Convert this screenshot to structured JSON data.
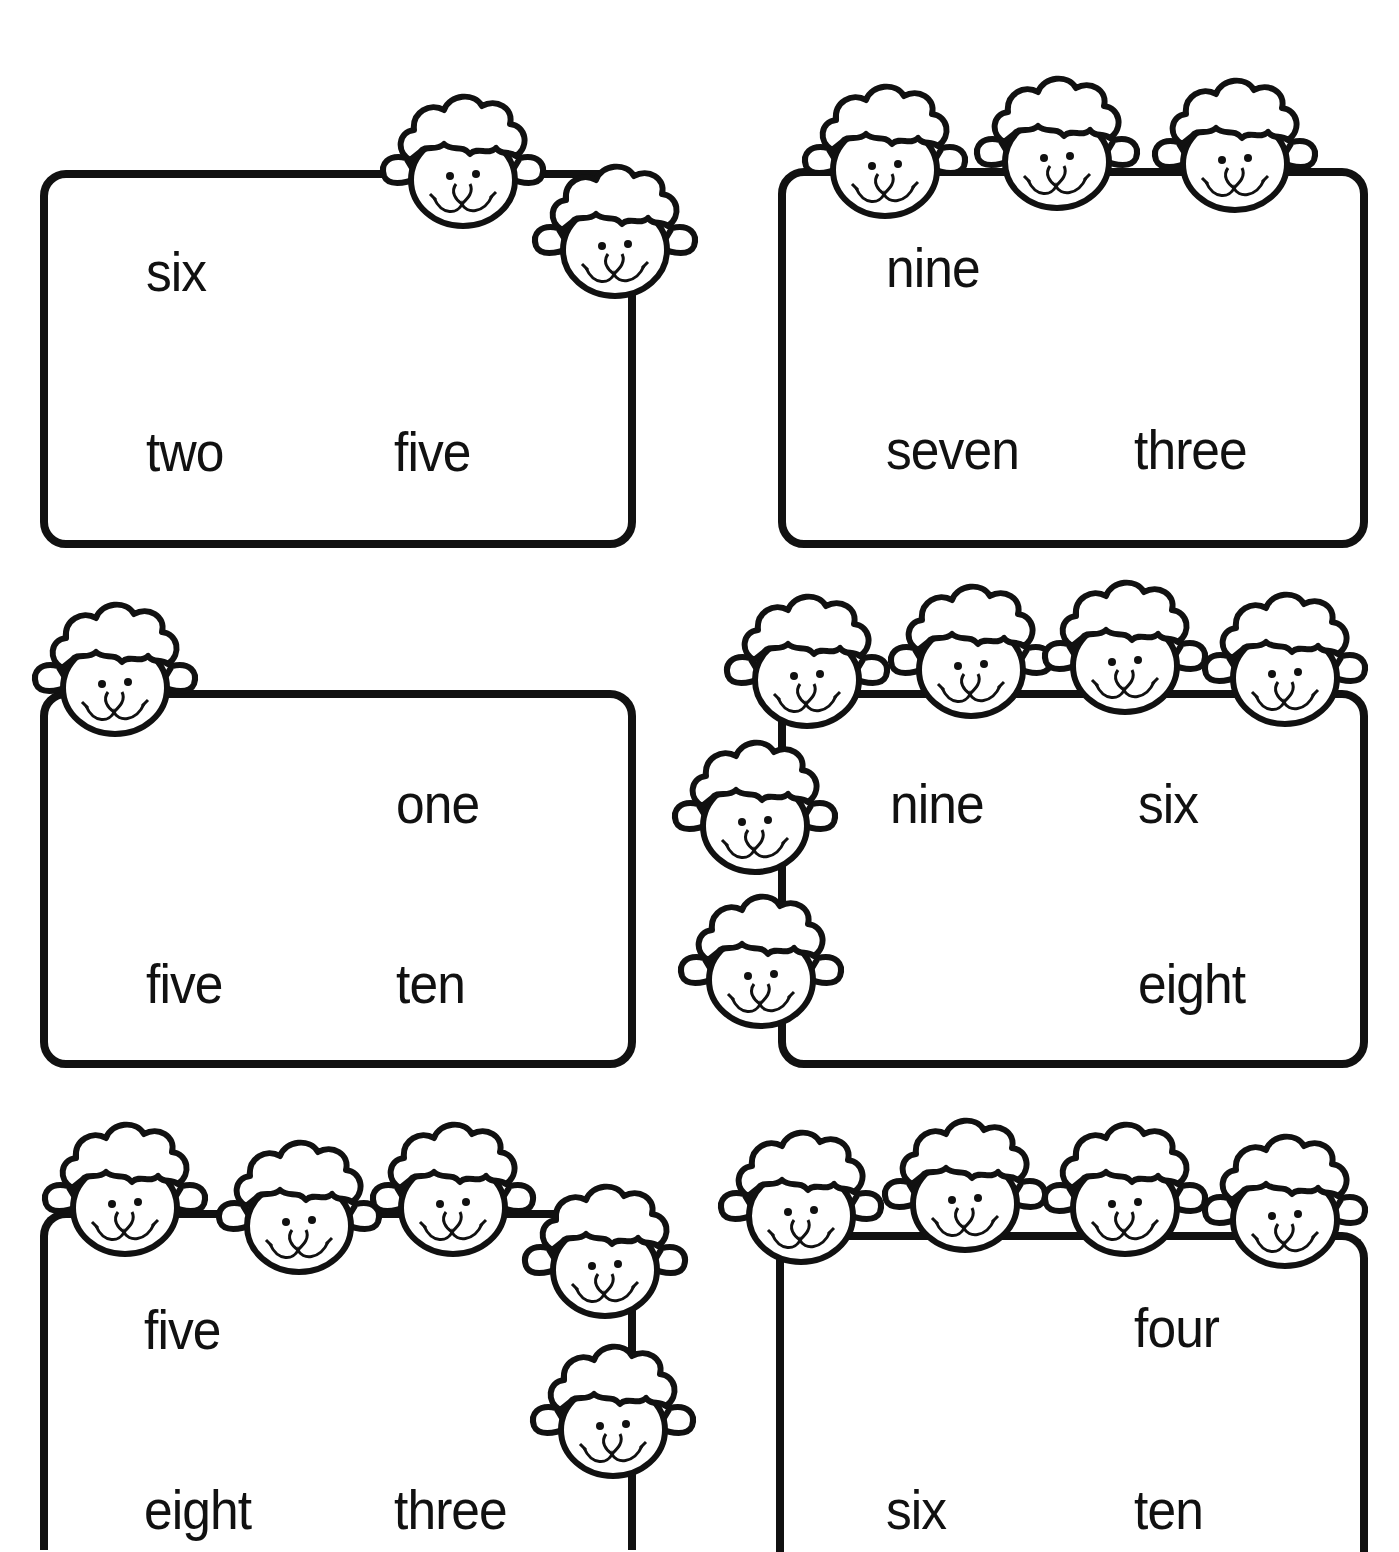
{
  "worksheet": {
    "colors": {
      "ink": "#111111",
      "paper": "#ffffff"
    },
    "cards": [
      {
        "id": 1,
        "sheep_count": 2,
        "words": [
          "six",
          "two",
          "five"
        ]
      },
      {
        "id": 2,
        "sheep_count": 3,
        "words": [
          "nine",
          "seven",
          "three"
        ]
      },
      {
        "id": 3,
        "sheep_count": 1,
        "words": [
          "one",
          "five",
          "ten"
        ]
      },
      {
        "id": 4,
        "sheep_count": 6,
        "words": [
          "nine",
          "six",
          "eight"
        ]
      },
      {
        "id": 5,
        "sheep_count": 6,
        "words": [
          "five",
          "eight",
          "three"
        ]
      },
      {
        "id": 6,
        "sheep_count": 4,
        "words": [
          "four",
          "six",
          "ten"
        ]
      }
    ]
  }
}
